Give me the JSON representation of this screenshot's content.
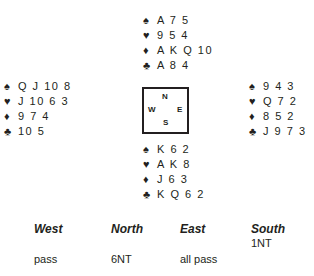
{
  "hands": {
    "north": {
      "spades": "A 7 5",
      "hearts": "9 5 4",
      "diamonds": "A K Q 10",
      "clubs": "A 8 4"
    },
    "west": {
      "spades": "Q J 10 8",
      "hearts": "J 10 6 3",
      "diamonds": "9 7 4",
      "clubs": "10 5"
    },
    "east": {
      "spades": "9 4 3",
      "hearts": "Q 7 2",
      "diamonds": "8 5 2",
      "clubs": "J 9 7 3"
    },
    "south": {
      "spades": "K 6 2",
      "hearts": "A K 8",
      "diamonds": "J 6 3",
      "clubs": "K Q 6 2"
    }
  },
  "suit_symbols": {
    "spades": "♠",
    "hearts": "♥",
    "diamonds": "♦",
    "clubs": "♣"
  },
  "compass": {
    "n": "N",
    "w": "W",
    "e": "E",
    "s": "S"
  },
  "auction": {
    "headers": [
      "West",
      "North",
      "East",
      "South"
    ],
    "rows": [
      [
        "",
        "",
        "",
        "1NT"
      ],
      [
        "pass",
        "6NT",
        "all pass",
        ""
      ]
    ]
  }
}
